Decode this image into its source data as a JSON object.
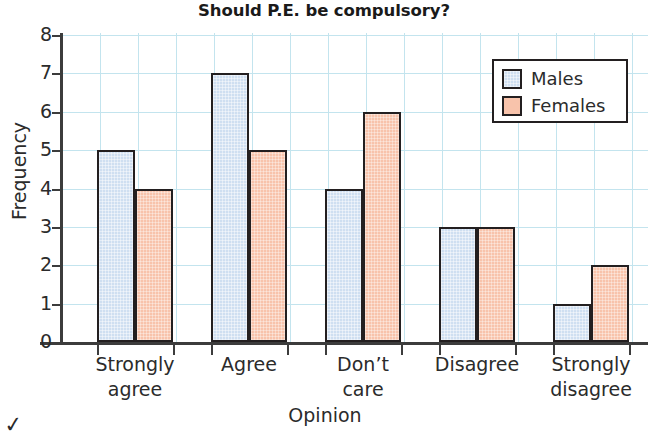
{
  "chart_data": {
    "type": "bar",
    "title": "Should P.E. be compulsory?",
    "xlabel": "Opinion",
    "ylabel": "Frequency",
    "categories": [
      "Strongly agree",
      "Agree",
      "Don’t care",
      "Disagree",
      "Strongly disagree"
    ],
    "category_lines": [
      [
        "Strongly",
        "agree"
      ],
      [
        "Agree",
        ""
      ],
      [
        "Don’t",
        "care"
      ],
      [
        "Disagree",
        ""
      ],
      [
        "Strongly",
        "disagree"
      ]
    ],
    "series": [
      {
        "name": "Males",
        "color": "#cfdff1",
        "values": [
          5,
          7,
          4,
          3,
          1
        ]
      },
      {
        "name": "Females",
        "color": "#f8c3ab",
        "values": [
          4,
          5,
          6,
          3,
          2
        ]
      }
    ],
    "ylim": [
      0,
      8
    ],
    "ytick_labels": [
      "0",
      "1",
      "2",
      "3",
      "4",
      "5",
      "6",
      "7",
      "8"
    ],
    "ytick_values": [
      0,
      1,
      2,
      3,
      4,
      5,
      6,
      7,
      8
    ],
    "grid": true,
    "grid_color": "#c3e4ee",
    "bar_outline_color": "#231f20",
    "legend_position": "top-right",
    "legend_entries": [
      "Males",
      "Females"
    ]
  },
  "artifact": {
    "mark": "✓"
  }
}
